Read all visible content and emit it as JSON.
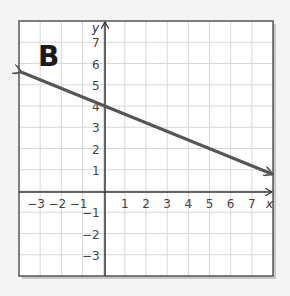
{
  "panel_label": "B",
  "chart_data": {
    "type": "line",
    "title": "",
    "panel_label": "B",
    "xlabel": "x",
    "ylabel": "y",
    "xlim": [
      -4,
      8
    ],
    "ylim": [
      -4,
      8
    ],
    "grid": true,
    "x_ticks": [
      -3,
      -2,
      -1,
      1,
      2,
      3,
      4,
      5,
      6,
      7
    ],
    "y_ticks": [
      7,
      6,
      5,
      4,
      3,
      2,
      1,
      -1,
      -2,
      -3
    ],
    "x_tick_labels": [
      "−3",
      "−2",
      "−1",
      "1",
      "2",
      "3",
      "4",
      "5",
      "6",
      "7"
    ],
    "y_tick_labels": [
      "7",
      "6",
      "5",
      "4",
      "3",
      "2",
      "1",
      "−1",
      "−2",
      "−3"
    ],
    "series": [
      {
        "name": "line",
        "equation": "y = -0.4x + 4",
        "slope": -0.4,
        "y_intercept": 4,
        "x": [
          -4,
          0,
          8
        ],
        "y": [
          5.6,
          4,
          0.8
        ],
        "arrows_both_ends": true,
        "color": "#555555"
      }
    ]
  },
  "colors": {
    "grid": "#d8d8d8",
    "axis": "#333333",
    "frame": "#555555",
    "line": "#555555",
    "background": "#ffffff"
  }
}
